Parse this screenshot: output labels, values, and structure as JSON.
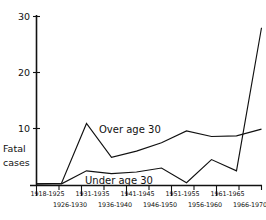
{
  "chart_data": {
    "type": "line",
    "title": "",
    "xlabel": "",
    "ylabel": "Fatal cases",
    "ylabel_line1": "Fatal",
    "ylabel_line2": "cases",
    "ylim": [
      0,
      30
    ],
    "yticks": [
      0,
      10,
      20,
      30
    ],
    "ytick_labels": [
      "",
      "10",
      "20",
      "30"
    ],
    "grid": false,
    "legend_position": "inline-annotation",
    "categories": [
      "1918-1925",
      "1926-1930",
      "1931-1935",
      "1936-1940",
      "1941-1945",
      "1946-1950",
      "1951-1955",
      "1956-1960",
      "1961-1965",
      "1966-1970"
    ],
    "categories_top_row": [
      "1918-1925",
      "1931-1935",
      "1941-1945",
      "1951-1955",
      "1961-1965"
    ],
    "categories_bottom_row": [
      "1926-1930",
      "1936-1940",
      "1946-1950",
      "1956-1960",
      "1966-1970"
    ],
    "series": [
      {
        "name": "Over age 30",
        "values": [
          0.3,
          0.4,
          11.0,
          5.0,
          6.1,
          7.6,
          9.7,
          8.7,
          8.8,
          10.0
        ]
      },
      {
        "name": "Under age 30",
        "values": [
          0.3,
          0.3,
          2.6,
          2.1,
          2.4,
          3.1,
          0.5,
          4.6,
          2.6,
          28.0
        ]
      }
    ],
    "annotations": [
      {
        "text": "Over age 30",
        "series": "Over age 30"
      },
      {
        "text": "Under age 30",
        "series": "Under age 30"
      }
    ],
    "colors": {
      "line": "#111111",
      "axis": "#111111",
      "background": "#ffffff"
    }
  }
}
